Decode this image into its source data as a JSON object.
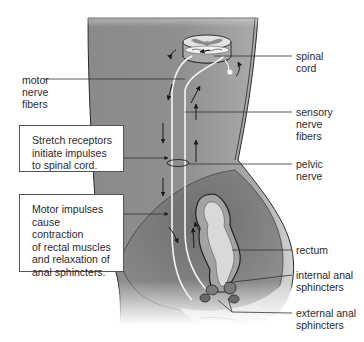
{
  "diagram": {
    "type": "anatomical reflex pathway",
    "labels": {
      "motor_nerve_fibers": "motor\nnerve\nfibers",
      "spinal_cord": "spinal\ncord",
      "sensory_nerve_fibers": "sensory\nnerve\nfibers",
      "pelvic_nerve": "pelvic\nnerve",
      "rectum": "rectum",
      "internal_anal_sphincters": "internal anal\nsphincters",
      "external_anal_sphincters": "external anal\nsphincters"
    },
    "callouts": {
      "stretch_receptors": "Stretch receptors\ninitiate impulses\nto spinal cord.",
      "motor_impulses": "Motor impulses\ncause contraction\nof rectal muscles\nand relaxation of\nanal sphincters."
    },
    "colors": {
      "body_fill_dark": "#6e6e6e",
      "body_fill_mid": "#9a9a9a",
      "body_fill_light": "#d8d8d8",
      "nerve_stroke": "#f4f4f4",
      "outline": "#333333",
      "leader_line": "#333333"
    }
  }
}
